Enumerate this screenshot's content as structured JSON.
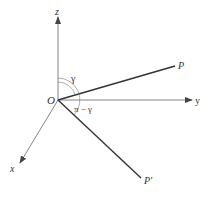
{
  "diagram": {
    "type": "3d-coordinate-axes",
    "origin_label": "O",
    "axes": {
      "x": {
        "label": "x"
      },
      "y": {
        "label": "y"
      },
      "z": {
        "label": "z"
      }
    },
    "vectors": [
      {
        "name": "P",
        "label": "P"
      },
      {
        "name": "P-prime",
        "label": "P′"
      }
    ],
    "angles": [
      {
        "name": "gamma",
        "label": "γ",
        "between": [
          "z",
          "P"
        ]
      },
      {
        "name": "pi-minus-gamma",
        "label": "π − γ",
        "between": [
          "z",
          "P-prime"
        ]
      }
    ],
    "colors": {
      "line": "#555555",
      "vector": "#333333",
      "text": "#333333",
      "background": "#ffffff"
    }
  }
}
